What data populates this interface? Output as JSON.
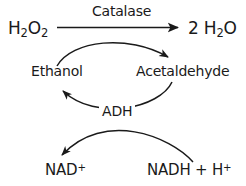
{
  "diagram": {
    "background_color": "#ffffff",
    "stroke_color": "#1a1a1a",
    "nodes": {
      "substrate_peroxide": {
        "text_main": "H",
        "sub_1": "2",
        "text_mid": "O",
        "sub_2": "2",
        "full": "H2O2"
      },
      "product_water": {
        "coefficient": "2 H",
        "sub_1": "2",
        "text_tail": "O",
        "full": "2 H2O"
      },
      "ethanol": {
        "label": "Ethanol"
      },
      "acetaldehyde": {
        "label": "Acetaldehyde"
      },
      "nad_plus": {
        "base": "NAD",
        "charge": "+",
        "full": "NAD+"
      },
      "nadh_h_plus": {
        "base": "NADH + H",
        "charge": "+",
        "full": "NADH + H+"
      }
    },
    "enzymes": {
      "catalase": {
        "label": "Catalase"
      },
      "adh": {
        "label": "ADH"
      }
    },
    "arrows": [
      {
        "name": "catalase-main-arrow",
        "from": "H2O2",
        "to": "2 H2O",
        "style": "straight"
      },
      {
        "name": "ethanol-to-acetaldehyde-arrow",
        "from": "Ethanol",
        "to": "Acetaldehyde",
        "style": "curved-over"
      },
      {
        "name": "acetaldehyde-to-ethanol-arrow",
        "from": "Acetaldehyde",
        "to": "Ethanol",
        "style": "curved-under"
      },
      {
        "name": "nadhh-to-nad-arrow",
        "from": "NADH + H+",
        "to": "NAD+",
        "style": "curved-crossing"
      }
    ]
  }
}
